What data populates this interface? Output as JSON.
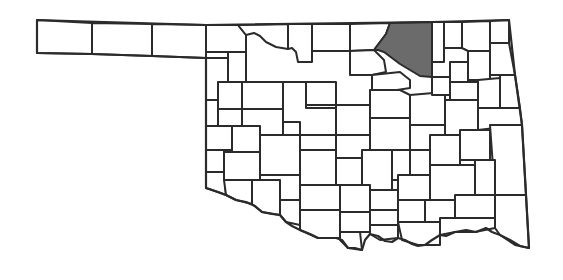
{
  "map": {
    "subject": "Oklahoma counties",
    "colors": {
      "background": "#ffffff",
      "county_fill": "#ffffff",
      "highlight_fill": "#6b6b6b",
      "border": "#2b2b2b"
    },
    "highlighted_counties": [
      {
        "name": "Major",
        "region": "west-central"
      },
      {
        "name": "Osage",
        "region": "north-east"
      }
    ],
    "counties": [
      {
        "id": "cimarron",
        "points": "37,20 92,23 92,54 37,53",
        "highlight": false
      },
      {
        "id": "texas",
        "points": "92,23 152,24 152,56 92,54",
        "highlight": false
      },
      {
        "id": "beaver",
        "points": "152,24 206,25 206,58 152,56",
        "highlight": false
      },
      {
        "id": "harper",
        "points": "206,25 238,25 246,35 246,52 228,52 228,52 206,52",
        "highlight": false
      },
      {
        "id": "woods",
        "points": "238,25 288,24 288,49 276,47 266,42 260,36 254,33 246,35",
        "highlight": false
      },
      {
        "id": "alfalfa",
        "points": "288,24 312,24 312,62 298,62 296,52 292,48 288,49",
        "highlight": false
      },
      {
        "id": "grant",
        "points": "312,24 350,24 350,51 312,51",
        "highlight": false
      },
      {
        "id": "kay",
        "points": "350,24 390,23 386,34 380,42 374,50 350,51",
        "highlight": false
      },
      {
        "id": "osage",
        "points": "390,23 432,22 432,77 420,76 410,70 400,64 392,58 384,52 378,50 374,50 380,42 386,34",
        "highlight": true
      },
      {
        "id": "washington",
        "points": "432,22 444,22 444,62 432,62",
        "highlight": false
      },
      {
        "id": "nowata",
        "points": "444,22 462,22 462,48 444,48",
        "highlight": false
      },
      {
        "id": "craig",
        "points": "462,22 490,21 490,51 468,51 462,48",
        "highlight": false
      },
      {
        "id": "ottawa",
        "points": "490,21 509,20 509,43 490,43",
        "highlight": false
      },
      {
        "id": "woodward",
        "points": "206,52 228,52 228,82 242,82 242,58 246,52 206,52",
        "highlight": false
      },
      {
        "id": "ellis",
        "points": "206,58 228,58 228,82 232,82 232,92 218,100 206,100",
        "highlight": false
      },
      {
        "id": "woodward2",
        "points": "228,52 246,52 246,82 228,82",
        "highlight": false
      },
      {
        "id": "major",
        "points": "283,82 306,82 306,108 300,108 300,122 283,122",
        "highlight": true
      },
      {
        "id": "garfield",
        "points": "306,82 336,82 336,105 306,105",
        "highlight": false
      },
      {
        "id": "noble",
        "points": "350,51 374,50 384,60 386,72 372,75 350,75",
        "highlight": false
      },
      {
        "id": "pawnee",
        "points": "372,75 400,72 410,80 410,88 384,92 372,90",
        "highlight": false
      },
      {
        "id": "blaine",
        "points": "242,82 283,82 283,109 242,109",
        "highlight": false
      },
      {
        "id": "dewey",
        "points": "218,82 242,82 242,109 218,109",
        "highlight": false
      },
      {
        "id": "roger-mills",
        "points": "206,100 218,100 218,126 206,126",
        "highlight": false
      },
      {
        "id": "kingfisher",
        "points": "283,122 300,122 300,135 336,135 336,108 306,108 306,82 283,82",
        "highlight": false
      },
      {
        "id": "logan",
        "points": "336,105 370,105 370,135 336,135",
        "highlight": false
      },
      {
        "id": "payne",
        "points": "370,90 400,90 410,95 410,118 370,118",
        "highlight": false
      },
      {
        "id": "creek",
        "points": "410,95 445,92 445,125 410,125",
        "highlight": false
      },
      {
        "id": "tulsa",
        "points": "432,77 450,77 450,95 432,95",
        "highlight": false
      },
      {
        "id": "rogers",
        "points": "450,62 468,62 468,82 450,82",
        "highlight": false
      },
      {
        "id": "mayes",
        "points": "468,51 490,51 490,80 468,80",
        "highlight": false
      },
      {
        "id": "delaware",
        "points": "490,43 509,43 515,75 490,75",
        "highlight": false
      },
      {
        "id": "wagoner",
        "points": "450,82 478,82 478,100 450,100",
        "highlight": false
      },
      {
        "id": "cherokee",
        "points": "478,80 500,78 500,108 478,108",
        "highlight": false
      },
      {
        "id": "adair",
        "points": "500,75 515,75 520,108 500,108",
        "highlight": false
      },
      {
        "id": "custer",
        "points": "242,109 283,109 283,135 242,135",
        "highlight": false
      },
      {
        "id": "beckham",
        "points": "206,126 232,126 232,150 206,150",
        "highlight": false
      },
      {
        "id": "washita",
        "points": "232,126 260,126 260,152 232,152",
        "highlight": false
      },
      {
        "id": "caddo",
        "points": "260,135 300,135 300,175 260,175",
        "highlight": false
      },
      {
        "id": "canadian",
        "points": "300,135 336,135 336,150 300,150",
        "highlight": false
      },
      {
        "id": "oklahoma",
        "points": "336,135 370,135 370,158 336,158",
        "highlight": false
      },
      {
        "id": "lincoln",
        "points": "370,118 410,118 410,150 370,150",
        "highlight": false
      },
      {
        "id": "okmulgee",
        "points": "410,125 445,125 445,150 410,150",
        "highlight": false
      },
      {
        "id": "muskogee",
        "points": "445,100 478,100 478,135 445,135",
        "highlight": false
      },
      {
        "id": "sequoyah",
        "points": "478,108 520,108 522,125 478,130",
        "highlight": false
      },
      {
        "id": "greer",
        "points": "206,150 224,150 224,172 206,172",
        "highlight": false
      },
      {
        "id": "harmon",
        "points": "206,172 224,172 226,195 212,190 206,188",
        "highlight": false
      },
      {
        "id": "kiowa",
        "points": "224,152 260,152 260,180 224,180",
        "highlight": false
      },
      {
        "id": "jackson",
        "points": "224,180 252,180 252,204 236,200 226,195",
        "highlight": false
      },
      {
        "id": "grady",
        "points": "300,150 336,150 336,185 300,185",
        "highlight": false
      },
      {
        "id": "cleveland",
        "points": "336,158 362,158 362,185 336,185",
        "highlight": false
      },
      {
        "id": "pottawatomie",
        "points": "362,150 392,150 392,190 362,190",
        "highlight": false
      },
      {
        "id": "seminole",
        "points": "392,150 410,150 410,180 392,180",
        "highlight": false
      },
      {
        "id": "okfuskee",
        "points": "410,150 430,150 430,175 410,175",
        "highlight": false
      },
      {
        "id": "mcintosh",
        "points": "430,135 460,135 460,165 430,165",
        "highlight": false
      },
      {
        "id": "haskell",
        "points": "460,130 490,130 490,160 460,160",
        "highlight": false
      },
      {
        "id": "le-flore",
        "points": "490,125 522,125 526,195 495,195",
        "highlight": false
      },
      {
        "id": "tillman",
        "points": "252,180 280,180 280,215 262,212 252,204",
        "highlight": false
      },
      {
        "id": "comanche",
        "points": "260,175 300,175 300,200 280,200 280,180 260,180",
        "highlight": false
      },
      {
        "id": "cotton",
        "points": "280,200 300,200 300,225 286,222 280,215",
        "highlight": false
      },
      {
        "id": "stephens",
        "points": "300,185 340,185 340,210 300,210",
        "highlight": false
      },
      {
        "id": "garvin",
        "points": "340,185 370,185 370,212 340,212",
        "highlight": false
      },
      {
        "id": "pontotoc",
        "points": "370,190 398,190 398,210 370,210",
        "highlight": false
      },
      {
        "id": "hughes",
        "points": "398,175 430,175 430,200 398,200",
        "highlight": false
      },
      {
        "id": "pittsburg",
        "points": "430,165 475,165 475,200 430,200",
        "highlight": false
      },
      {
        "id": "latimer",
        "points": "475,160 495,160 495,195 475,195",
        "highlight": false
      },
      {
        "id": "jefferson",
        "points": "300,210 340,210 340,238 318,238 300,230",
        "highlight": false
      },
      {
        "id": "carter",
        "points": "340,212 370,212 370,232 340,232",
        "highlight": false
      },
      {
        "id": "murray",
        "points": "370,210 398,210 398,225 370,225",
        "highlight": false
      },
      {
        "id": "coal",
        "points": "398,200 425,200 425,222 398,222",
        "highlight": false
      },
      {
        "id": "atoka",
        "points": "425,200 455,200 455,225 425,225",
        "highlight": false
      },
      {
        "id": "pushmataha",
        "points": "455,195 495,195 495,218 455,218",
        "highlight": false
      },
      {
        "id": "mccurtain",
        "points": "495,195 526,195 529,248 515,245 500,235 495,228",
        "highlight": false
      },
      {
        "id": "love",
        "points": "340,232 360,232 362,250 348,248 340,240",
        "highlight": false
      },
      {
        "id": "marshall",
        "points": "370,225 398,225 398,238 380,240 370,234",
        "highlight": false
      },
      {
        "id": "bryan",
        "points": "398,222 440,222 440,245 418,245 402,240",
        "highlight": false
      },
      {
        "id": "choctaw",
        "points": "440,218 495,218 495,228 475,232 455,232 440,235",
        "highlight": false
      }
    ]
  }
}
